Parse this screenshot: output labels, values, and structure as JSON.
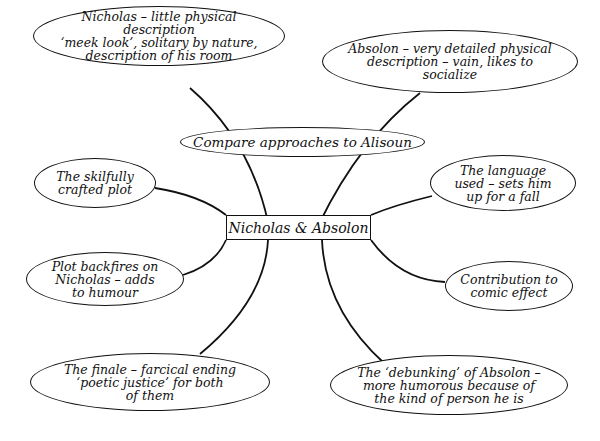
{
  "diagram": {
    "type": "mind-map",
    "center": {
      "label": "Nicholas & Absolon"
    },
    "hub": {
      "label": "Compare approaches to Alisoun"
    },
    "nodes": [
      {
        "id": "nicholas-description",
        "label": "Nicholas – little physical description\n‘meek look’, solitary by nature,\ndescription of his room"
      },
      {
        "id": "absolon-description",
        "label": "Absolon – very detailed physical\ndescription – vain, likes to\nsocialize"
      },
      {
        "id": "crafted-plot",
        "label": "The skilfully\ncrafted plot"
      },
      {
        "id": "language-used",
        "label": "The language\nused – sets him\nup for a fall"
      },
      {
        "id": "plot-backfires",
        "label": "Plot backfires on\nNicholas – adds\nto humour"
      },
      {
        "id": "comic-effect",
        "label": "Contribution to\ncomic effect"
      },
      {
        "id": "finale",
        "label": "The finale – farcical ending\n‘poetic justice’ for both\nof them"
      },
      {
        "id": "debunking",
        "label": "The ‘debunking’ of Absolon –\nmore humorous because of\nthe kind of person he is"
      }
    ],
    "colors": {
      "ink": "#111111",
      "background": "#ffffff"
    }
  }
}
